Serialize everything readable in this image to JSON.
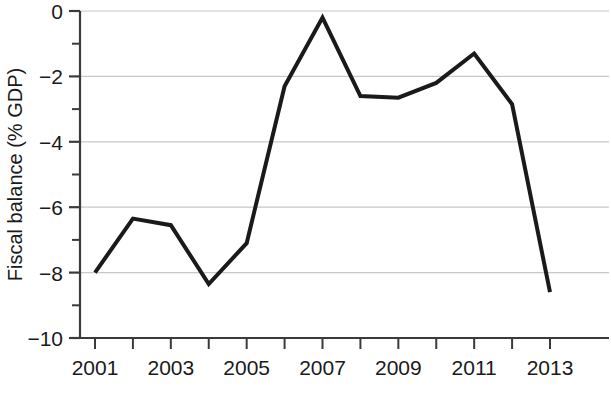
{
  "chart_data": {
    "type": "line",
    "title": "",
    "xlabel": "",
    "ylabel": "Fiscal balance (% GDP)",
    "x": [
      2001,
      2002,
      2003,
      2004,
      2005,
      2006,
      2007,
      2008,
      2009,
      2010,
      2011,
      2012,
      2013
    ],
    "values": [
      -8.0,
      -6.35,
      -6.55,
      -8.35,
      -7.1,
      -2.3,
      -0.2,
      -2.6,
      -2.65,
      -2.2,
      -1.3,
      -2.85,
      -8.6
    ],
    "series": [
      {
        "name": "Fiscal balance",
        "values": [
          -8.0,
          -6.35,
          -6.55,
          -8.35,
          -7.1,
          -2.3,
          -0.2,
          -2.6,
          -2.65,
          -2.2,
          -1.3,
          -2.85,
          -8.6
        ],
        "color": "#1a1a1a"
      }
    ],
    "xlim": [
      2001,
      2013
    ],
    "ylim": [
      -10,
      0
    ],
    "ytick_values": [
      0,
      -2,
      -4,
      -6,
      -8,
      -10
    ],
    "ytick_labels": [
      "0",
      "−2",
      "−4",
      "−6",
      "−8",
      "−10"
    ],
    "yminor_values": [
      -1,
      -3,
      -5,
      -7,
      -9
    ],
    "xtick_values": [
      2001,
      2002,
      2003,
      2004,
      2005,
      2006,
      2007,
      2008,
      2009,
      2010,
      2011,
      2012,
      2013
    ],
    "xtick_labels": [
      "2001",
      "",
      "2003",
      "",
      "2005",
      "",
      "2007",
      "",
      "2009",
      "",
      "2011",
      "",
      "2013"
    ],
    "grid": {
      "horizontal": true,
      "vertical": false,
      "color": "#c8c8c8"
    },
    "legend": {
      "visible": false,
      "position": "none"
    },
    "line_width": 4,
    "axis_color": "#3a3a3a",
    "text_color": "#1a1a1a",
    "background": "#ffffff"
  }
}
